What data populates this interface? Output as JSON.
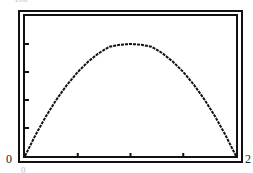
{
  "chart_data": {
    "type": "line",
    "title": "",
    "xlabel": "",
    "ylabel": "",
    "xlim": [
      0,
      2
    ],
    "ylim": [
      0,
      100
    ],
    "x_tick_labels": {
      "left": "0",
      "right": "2"
    },
    "y_top_label_partial": "100",
    "x_bottom_label_partial": "0",
    "x_ticks": [
      0.5,
      1.0,
      1.5
    ],
    "y_ticks": [
      20,
      40,
      60,
      80
    ],
    "grid": false,
    "legend": null,
    "series": [
      {
        "name": "parabola",
        "x": [
          0,
          0.1,
          0.2,
          0.3,
          0.4,
          0.5,
          0.6,
          0.7,
          0.8,
          0.9,
          1.0,
          1.1,
          1.2,
          1.3,
          1.4,
          1.5,
          1.6,
          1.7,
          1.8,
          1.9,
          2.0
        ],
        "values": [
          0,
          15,
          28.5,
          40.5,
          51,
          60,
          67.5,
          73.5,
          78,
          79.5,
          80,
          79.5,
          78,
          73.5,
          67.5,
          60,
          51,
          40.5,
          28.5,
          15,
          0
        ]
      }
    ],
    "color": "#111111"
  },
  "labels": {
    "x_min": "0",
    "x_max": "2",
    "top_partial": "100",
    "bottom_partial": "0"
  }
}
